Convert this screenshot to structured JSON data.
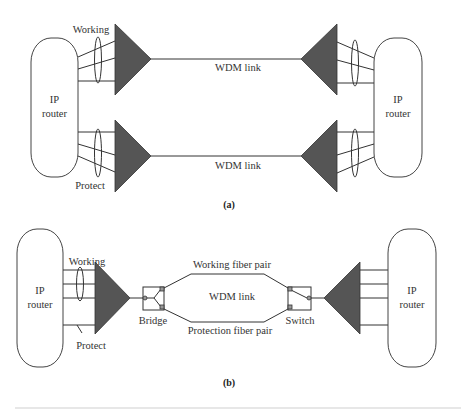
{
  "diagram_a": {
    "caption": "(a)",
    "left_router": {
      "line1": "IP",
      "line2": "router"
    },
    "right_router": {
      "line1": "IP",
      "line2": "router"
    },
    "working_label": "Working",
    "protect_label": "Protect",
    "top_link_label": "WDM link",
    "bottom_link_label": "WDM link"
  },
  "diagram_b": {
    "caption": "(b)",
    "left_router": {
      "line1": "IP",
      "line2": "router"
    },
    "right_router": {
      "line1": "IP",
      "line2": "router"
    },
    "working_label": "Working",
    "protect_label": "Protect",
    "bridge_label": "Bridge",
    "switch_label": "Switch",
    "working_fiber_label": "Working fiber pair",
    "protection_fiber_label": "Protection fiber pair",
    "link_label": "WDM link"
  },
  "colors": {
    "mux_fill": "#555555",
    "line": "#333333",
    "background": "#ffffff"
  }
}
